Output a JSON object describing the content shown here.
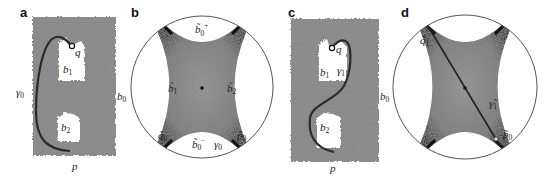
{
  "figure": {
    "panels": [
      {
        "id": "a",
        "label": "a",
        "type": "surface-with-holes",
        "labels": {
          "q": "q",
          "b1": "b",
          "b1_sub": "1",
          "gamma0": "γ",
          "gamma0_sub": "0",
          "b0": "b",
          "b0_sub": "0",
          "b2": "b",
          "b2_sub": "2",
          "p": "p"
        }
      },
      {
        "id": "b",
        "label": "b",
        "type": "hyperbolic-disk",
        "labels": {
          "b0_plus": "b̃",
          "b0_plus_sub": "0",
          "b0_plus_sup": "+",
          "b1": "b̃",
          "b1_sub": "1",
          "b2": "b̃",
          "b2_sub": "2",
          "q0": "q̃",
          "q0_sub": "0",
          "b0_minus": "b̃",
          "b0_minus_sub": "0",
          "b0_minus_sup": "−",
          "gamma0": "γ",
          "gamma0_sub": "0",
          "p0": "p̃",
          "p0_sub": "0"
        }
      },
      {
        "id": "c",
        "label": "c",
        "type": "surface-with-holes",
        "labels": {
          "q": "q",
          "b1": "b",
          "b1_sub": "1",
          "gamma1": "γ",
          "gamma1_sub": "1",
          "b0": "b",
          "b0_sub": "0",
          "b2": "b",
          "b2_sub": "2",
          "p": "p"
        }
      },
      {
        "id": "d",
        "label": "d",
        "type": "hyperbolic-disk",
        "labels": {
          "q1": "q̃",
          "q1_sub": "1",
          "gamma1": "γ̃",
          "gamma1_sub": "1",
          "p0": "p̃",
          "p0_sub": "0"
        }
      }
    ],
    "colors": {
      "mesh_fill": "#8a8a8a",
      "mesh_dark": "#3a3a3a",
      "curve": "#2a2a2a",
      "circle_stroke": "#555555",
      "background": "#ffffff"
    }
  }
}
